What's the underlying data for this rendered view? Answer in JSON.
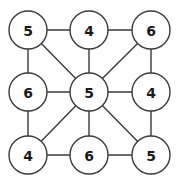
{
  "figure": {
    "type": "node-link-graph",
    "background_color": "#ffffff",
    "edge_color": "#3a3a3a",
    "node_fill_color": "#ffffff",
    "node_stroke_color": "#3a3a3a",
    "label_color": "#1a1a1a",
    "node_radius": 19,
    "width": 177,
    "height": 185
  },
  "graph": {
    "nodes": [
      {
        "id": "top-left",
        "label": "5",
        "x": 28,
        "y": 30
      },
      {
        "id": "top-center",
        "label": "4",
        "x": 89,
        "y": 30
      },
      {
        "id": "top-right",
        "label": "6",
        "x": 151,
        "y": 30
      },
      {
        "id": "middle-left",
        "label": "6",
        "x": 28,
        "y": 92
      },
      {
        "id": "center",
        "label": "5",
        "x": 89,
        "y": 92
      },
      {
        "id": "middle-right",
        "label": "4",
        "x": 151,
        "y": 92
      },
      {
        "id": "bottom-left",
        "label": "4",
        "x": 28,
        "y": 155
      },
      {
        "id": "bottom-center",
        "label": "6",
        "x": 89,
        "y": 155
      },
      {
        "id": "bottom-right",
        "label": "5",
        "x": 151,
        "y": 155
      }
    ],
    "edges": [
      {
        "from": "top-left",
        "to": "top-center"
      },
      {
        "from": "top-center",
        "to": "top-right"
      },
      {
        "from": "middle-left",
        "to": "center"
      },
      {
        "from": "center",
        "to": "middle-right"
      },
      {
        "from": "bottom-left",
        "to": "bottom-center"
      },
      {
        "from": "bottom-center",
        "to": "bottom-right"
      },
      {
        "from": "top-left",
        "to": "middle-left"
      },
      {
        "from": "middle-left",
        "to": "bottom-left"
      },
      {
        "from": "top-center",
        "to": "center"
      },
      {
        "from": "center",
        "to": "bottom-center"
      },
      {
        "from": "top-right",
        "to": "middle-right"
      },
      {
        "from": "middle-right",
        "to": "bottom-right"
      },
      {
        "from": "top-left",
        "to": "center"
      },
      {
        "from": "top-right",
        "to": "center"
      },
      {
        "from": "bottom-left",
        "to": "center"
      },
      {
        "from": "bottom-right",
        "to": "center"
      }
    ]
  }
}
